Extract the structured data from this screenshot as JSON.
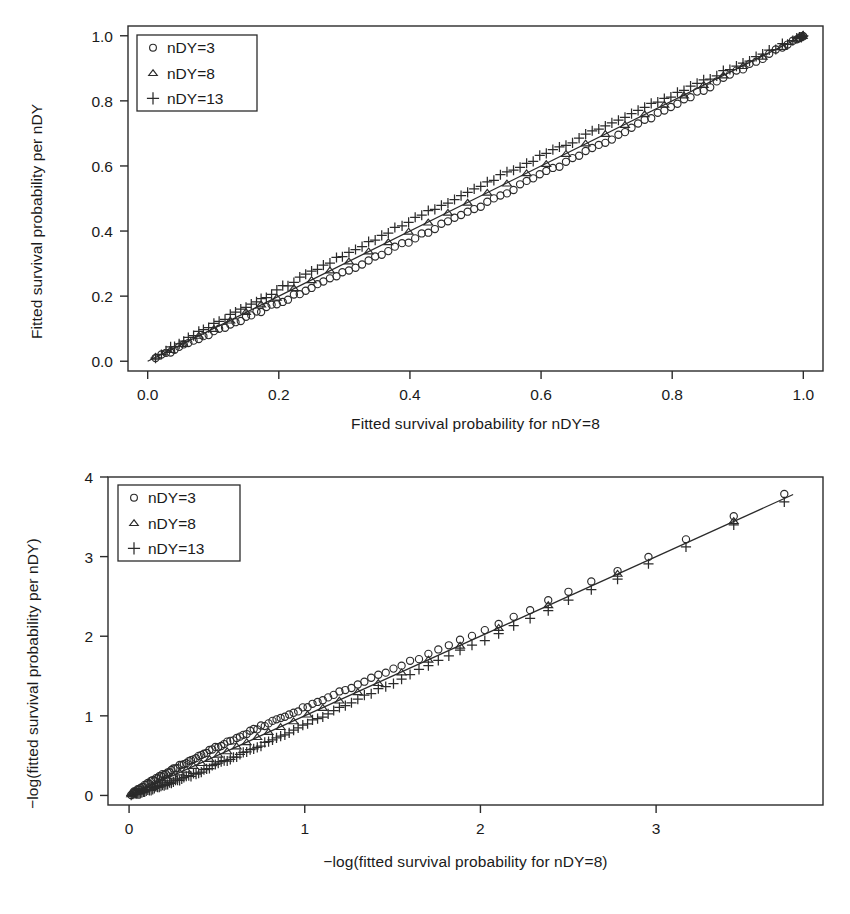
{
  "figure": {
    "panels": [
      "top",
      "bottom"
    ]
  },
  "chart_data": [
    {
      "id": "top",
      "type": "scatter",
      "title": "",
      "xlabel": "Fitted survival probability for nDY=8",
      "ylabel": "Fitted survival probability per nDY",
      "xlim": [
        -0.03,
        1.03
      ],
      "ylim": [
        -0.03,
        1.03
      ],
      "xticks": [
        0.0,
        0.2,
        0.4,
        0.6,
        0.8,
        1.0
      ],
      "yticks": [
        0.0,
        0.2,
        0.4,
        0.6,
        0.8,
        1.0
      ],
      "xticklabels": [
        "0.0",
        "0.2",
        "0.4",
        "0.6",
        "0.8",
        "1.0"
      ],
      "yticklabels": [
        "0.0",
        "0.2",
        "0.4",
        "0.6",
        "0.8",
        "1.0"
      ],
      "grid": false,
      "reference_line": {
        "type": "identity",
        "from": [
          0.0,
          0.0
        ],
        "to": [
          1.0,
          1.0
        ]
      },
      "legend": {
        "position": "top-left",
        "entries": [
          {
            "marker": "circle",
            "label": "nDY=3"
          },
          {
            "marker": "triangle",
            "label": "nDY=8"
          },
          {
            "marker": "plus",
            "label": "nDY=13"
          }
        ]
      },
      "x": [
        0.012,
        0.021,
        0.028,
        0.035,
        0.041,
        0.048,
        0.055,
        0.062,
        0.07,
        0.078,
        0.085,
        0.093,
        0.101,
        0.109,
        0.118,
        0.126,
        0.134,
        0.142,
        0.15,
        0.158,
        0.166,
        0.173,
        0.181,
        0.189,
        0.197,
        0.206,
        0.214,
        0.223,
        0.232,
        0.241,
        0.25,
        0.259,
        0.268,
        0.278,
        0.288,
        0.297,
        0.307,
        0.317,
        0.327,
        0.337,
        0.347,
        0.357,
        0.367,
        0.377,
        0.388,
        0.398,
        0.408,
        0.418,
        0.428,
        0.438,
        0.448,
        0.458,
        0.468,
        0.478,
        0.488,
        0.498,
        0.508,
        0.518,
        0.528,
        0.538,
        0.548,
        0.558,
        0.568,
        0.578,
        0.588,
        0.598,
        0.608,
        0.618,
        0.628,
        0.638,
        0.648,
        0.658,
        0.668,
        0.678,
        0.688,
        0.698,
        0.708,
        0.718,
        0.728,
        0.738,
        0.748,
        0.758,
        0.768,
        0.778,
        0.788,
        0.798,
        0.808,
        0.818,
        0.828,
        0.838,
        0.848,
        0.858,
        0.868,
        0.878,
        0.888,
        0.898,
        0.908,
        0.918,
        0.928,
        0.938,
        0.948,
        0.958,
        0.968,
        0.976,
        0.984,
        0.99,
        0.994,
        0.997,
        0.999,
        1.0
      ],
      "series": [
        {
          "name": "nDY=3",
          "marker": "circle",
          "offset_note": "slightly below identity, max deviation near mid-range"
        },
        {
          "name": "nDY=8",
          "marker": "triangle",
          "offset_note": "on identity line"
        },
        {
          "name": "nDY=13",
          "marker": "plus",
          "offset_note": "slightly above identity, max deviation near mid-range"
        }
      ]
    },
    {
      "id": "bottom",
      "type": "scatter",
      "title": "",
      "xlabel": "−log(fitted survival probability for nDY=8)",
      "ylabel": "−log(fitted survival probability per nDY)",
      "xlim": [
        -0.12,
        3.95
      ],
      "ylim": [
        -0.12,
        4.0
      ],
      "xticks": [
        0,
        1,
        2,
        3
      ],
      "yticks": [
        0,
        1,
        2,
        3,
        4
      ],
      "xticklabels": [
        "0",
        "1",
        "2",
        "3"
      ],
      "yticklabels": [
        "0",
        "1",
        "2",
        "3",
        "4"
      ],
      "grid": false,
      "reference_line": {
        "type": "identity",
        "from": [
          0.0,
          0.0
        ],
        "to": [
          3.78,
          3.78
        ]
      },
      "legend": {
        "position": "top-left",
        "entries": [
          {
            "marker": "circle",
            "label": "nDY=3"
          },
          {
            "marker": "triangle",
            "label": "nDY=8"
          },
          {
            "marker": "plus",
            "label": "nDY=13"
          }
        ]
      },
      "series": [
        {
          "name": "nDY=3",
          "marker": "circle",
          "offset_note": "above identity line, deviation grows with x"
        },
        {
          "name": "nDY=8",
          "marker": "triangle",
          "offset_note": "on identity line"
        },
        {
          "name": "nDY=13",
          "marker": "plus",
          "offset_note": "below identity line, deviation grows with x"
        }
      ]
    }
  ]
}
